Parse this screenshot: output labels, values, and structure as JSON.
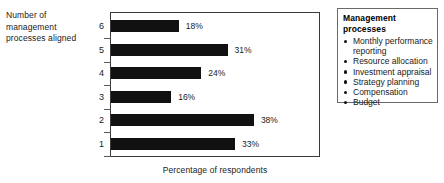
{
  "chart_data": {
    "type": "bar",
    "orientation": "horizontal",
    "title": "",
    "xlabel": "Percentage of respondents",
    "ylabel": "Number of management processes aligned",
    "categories": [
      "6",
      "5",
      "4",
      "3",
      "2",
      "1"
    ],
    "values": [
      18,
      31,
      24,
      16,
      38,
      33
    ],
    "value_labels": [
      "18%",
      "31%",
      "24%",
      "16%",
      "38%",
      "33%"
    ],
    "xlim": [
      0,
      55
    ],
    "grid": false,
    "legend_position": "right",
    "bar_color": "#111111"
  },
  "axis": {
    "y_caption_lines": [
      "Number of",
      "management",
      "processes aligned"
    ],
    "x_title": "Percentage of respondents"
  },
  "legend": {
    "title": "Management processes",
    "items": [
      "Monthly performance reporting",
      "Resource allocation",
      "Investment appraisal",
      "Strategy planning",
      "Compensation",
      "Budget"
    ]
  }
}
